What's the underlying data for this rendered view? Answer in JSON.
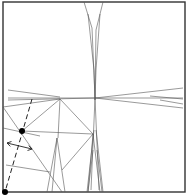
{
  "diagram": {
    "type": "origami-crease-pattern",
    "colors": {
      "frame": "#333333",
      "crease": "#555555",
      "dashed": "#222222",
      "dot": "#000000"
    },
    "frame": {
      "x": 3,
      "y": 2,
      "w": 182,
      "h": 190
    },
    "creases": [
      [
        84,
        2,
        92,
        28
      ],
      [
        103,
        2,
        96,
        30
      ],
      [
        88,
        14,
        94,
        70
      ],
      [
        100,
        14,
        96,
        70
      ],
      [
        92,
        28,
        95,
        98
      ],
      [
        96,
        30,
        95,
        98
      ],
      [
        94,
        70,
        95,
        100
      ],
      [
        96,
        70,
        95,
        100
      ],
      [
        95,
        98,
        91,
        190
      ],
      [
        95,
        98,
        99,
        190
      ],
      [
        94,
        130,
        87,
        192
      ],
      [
        96,
        130,
        103,
        192
      ],
      [
        93,
        150,
        88,
        192
      ],
      [
        97,
        150,
        102,
        192
      ],
      [
        8,
        90,
        60,
        97
      ],
      [
        8,
        98,
        183,
        98
      ],
      [
        8,
        100,
        95,
        98
      ],
      [
        95,
        98,
        183,
        88
      ],
      [
        95,
        98,
        183,
        108
      ],
      [
        150,
        96,
        183,
        99
      ],
      [
        160,
        100,
        183,
        104
      ],
      [
        3,
        107,
        60,
        99
      ],
      [
        60,
        99,
        93,
        134
      ],
      [
        60,
        99,
        22,
        131
      ],
      [
        60,
        99,
        58,
        138
      ],
      [
        22,
        131,
        93,
        134
      ],
      [
        93,
        134,
        62,
        170
      ],
      [
        3,
        107,
        62,
        192
      ],
      [
        3,
        128,
        40,
        136
      ],
      [
        6,
        165,
        50,
        172
      ],
      [
        57,
        138,
        47,
        192
      ],
      [
        57,
        138,
        65,
        192
      ],
      [
        57,
        138,
        52,
        192
      ],
      [
        93,
        134,
        88,
        192
      ],
      [
        93,
        134,
        100,
        192
      ]
    ],
    "dashed_lines": [
      [
        32,
        99,
        5,
        192
      ]
    ],
    "dots": [
      {
        "x": 22,
        "y": 131,
        "r": 3
      },
      {
        "x": 5,
        "y": 192,
        "r": 3
      }
    ],
    "arrow": {
      "from": [
        7,
        143
      ],
      "to": [
        32,
        149
      ],
      "double_headed": true
    }
  }
}
